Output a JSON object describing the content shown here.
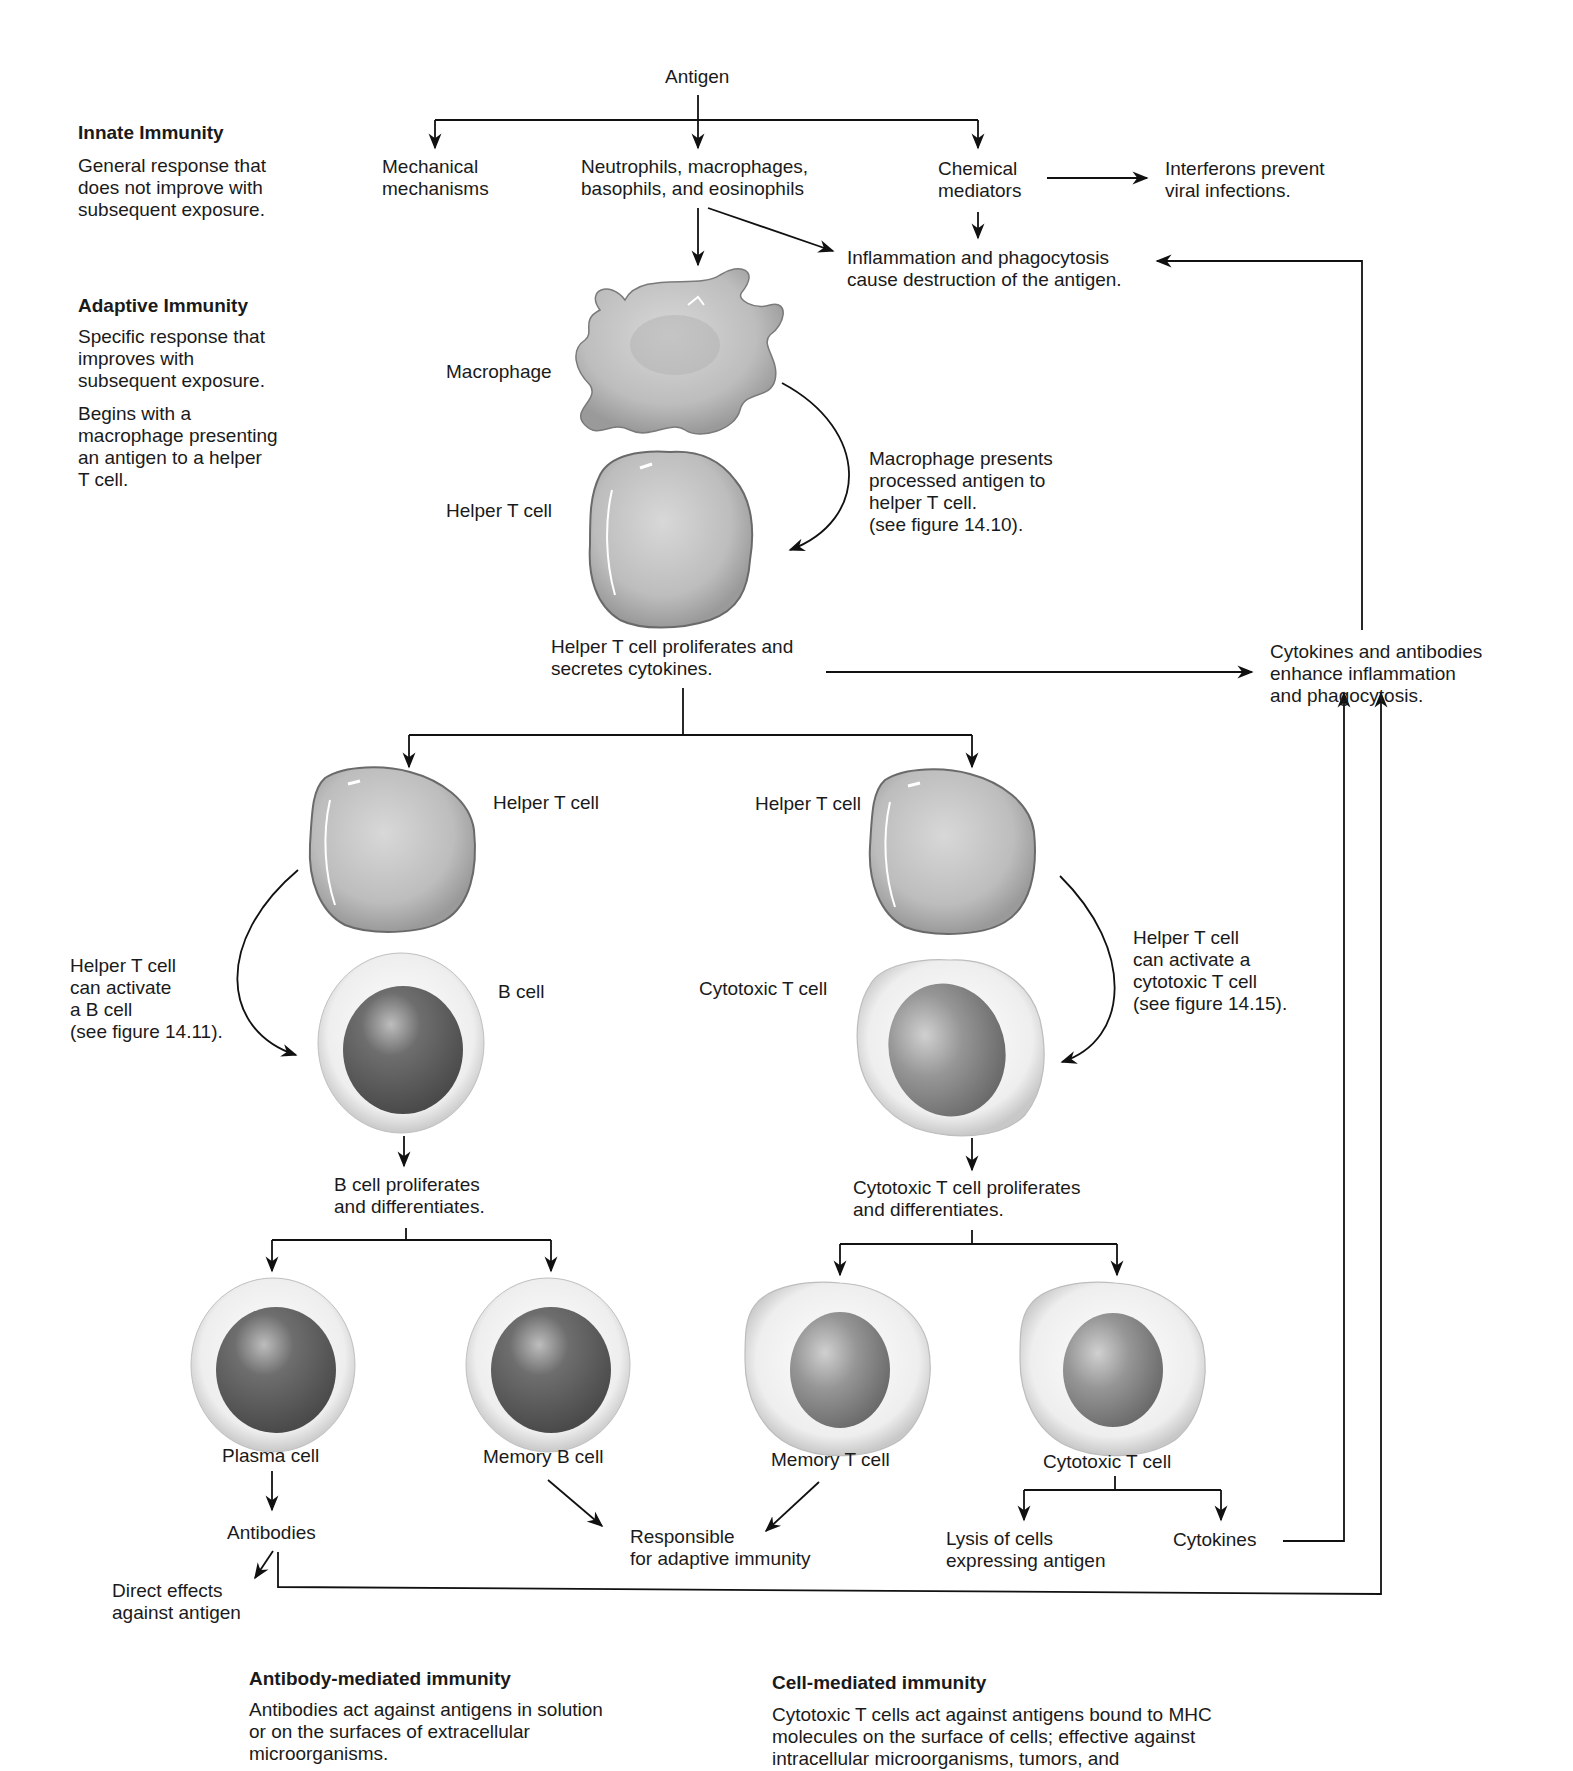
{
  "sidebar": {
    "innate": {
      "title": "Innate Immunity",
      "body": "General response that\ndoes not improve with\nsubsequent exposure."
    },
    "adaptive": {
      "title": "Adaptive Immunity",
      "body1": "Specific response that\nimproves with\nsubsequent exposure.",
      "body2": "Begins with a\nmacrophage presenting\nan antigen to a helper\nT cell."
    }
  },
  "innate_flow": {
    "antigen": "Antigen",
    "mechanical": "Mechanical\nmechanisms",
    "phagocytes": "Neutrophils, macrophages,\nbasophils, and eosinophils",
    "chemical": "Chemical\nmediators",
    "interferons": "Interferons prevent\nviral infections.",
    "inflammation": "Inflammation and phagocytosis\ncause destruction of the antigen."
  },
  "adaptive_flow": {
    "macrophage_label": "Macrophage",
    "helper_label": "Helper T cell",
    "presents_note": "Macrophage presents\nprocessed antigen to\nhelper T cell.\n(see figure 14.10).",
    "helper_proliferates": "Helper T cell proliferates and\nsecretes cytokines.",
    "enhance": "Cytokines and antibodies\nenhance inflammation\nand phagocytosis."
  },
  "antibody_branch": {
    "helper_label": "Helper T cell",
    "activate_note": "Helper T cell\ncan activate\na B cell\n(see figure 14.11).",
    "b_cell_label": "B cell",
    "proliferates": "B cell proliferates\nand differentiates.",
    "plasma_cell": "Plasma cell",
    "memory_b_cell": "Memory B cell",
    "antibodies": "Antibodies",
    "direct_effects": "Direct effects\nagainst antigen"
  },
  "cell_branch": {
    "helper_label": "Helper T cell",
    "activate_note": "Helper T cell\ncan activate a\ncytotoxic T cell\n(see figure 14.15).",
    "cytotoxic_label": "Cytotoxic T cell",
    "proliferates": "Cytotoxic T cell proliferates\nand differentiates.",
    "memory_t_cell": "Memory T cell",
    "cytotoxic_t_cell": "Cytotoxic T cell",
    "lysis": "Lysis of cells\nexpressing antigen",
    "cytokines": "Cytokines"
  },
  "shared": {
    "responsible": "Responsible\nfor adaptive immunity"
  },
  "footer": {
    "antibody_mediated": {
      "title": "Antibody-mediated immunity",
      "body": "Antibodies act against antigens in solution\nor on the surfaces of extracellular\nmicroorganisms."
    },
    "cell_mediated": {
      "title": "Cell-mediated immunity",
      "body": "Cytotoxic T cells act against antigens bound to MHC\nmolecules on the surface of cells; effective against\nintracellular microorganisms, tumors, and"
    }
  },
  "colors": {
    "line": "#111111",
    "cell_cytoplasm": "#c9c9c9",
    "cell_membrane_light": "#f0f0f0",
    "nucleus_dark": "#5a5a5a",
    "nucleus_light": "#8c8c8c"
  }
}
